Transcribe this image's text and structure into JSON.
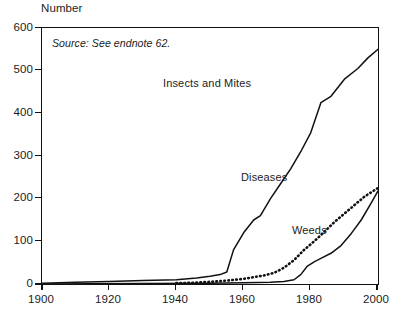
{
  "chart_data": {
    "type": "line",
    "title": "",
    "ylabel": "Number",
    "xlabel": "",
    "annotation": "Source: See endnote 62.",
    "xlim": [
      1900,
      2000
    ],
    "ylim": [
      0,
      600
    ],
    "yticks": [
      0,
      100,
      200,
      300,
      400,
      500,
      600
    ],
    "ytick_labels": [
      "0",
      "100",
      "200",
      "300",
      "400",
      "500",
      "600"
    ],
    "xticks": [
      1900,
      1920,
      1940,
      1960,
      1980,
      2000
    ],
    "xtick_labels": [
      "1900",
      "1920",
      "1940",
      "1960",
      "1980",
      "2000"
    ],
    "grid": false,
    "legend": "inline-labels",
    "series": [
      {
        "name": "Insects and Mites",
        "style": "solid",
        "color": "#111111",
        "x": [
          1900,
          1910,
          1920,
          1930,
          1940,
          1946,
          1950,
          1953,
          1955,
          1957,
          1960,
          1963,
          1965,
          1968,
          1971,
          1974,
          1977,
          1980,
          1983,
          1986,
          1990,
          1994,
          1997,
          2000
        ],
        "values": [
          2,
          4,
          6,
          8,
          10,
          14,
          18,
          22,
          28,
          80,
          120,
          150,
          160,
          200,
          235,
          270,
          310,
          355,
          425,
          440,
          480,
          505,
          530,
          550
        ]
      },
      {
        "name": "Diseases",
        "style": "dotted",
        "color": "#111111",
        "x": [
          1940,
          1945,
          1950,
          1955,
          1960,
          1963,
          1966,
          1969,
          1972,
          1975,
          1978,
          1981,
          1984,
          1987,
          1990,
          1993,
          1996,
          2000
        ],
        "values": [
          2,
          3,
          5,
          8,
          12,
          16,
          20,
          26,
          38,
          56,
          80,
          100,
          122,
          145,
          165,
          185,
          205,
          225
        ]
      },
      {
        "name": "Weeds",
        "style": "solid",
        "color": "#111111",
        "x": [
          1900,
          1930,
          1950,
          1960,
          1968,
          1972,
          1975,
          1977,
          1979,
          1981,
          1983,
          1986,
          1989,
          1992,
          1995,
          1998,
          2000
        ],
        "values": [
          0,
          1,
          2,
          3,
          4,
          6,
          10,
          22,
          42,
          52,
          60,
          72,
          90,
          118,
          150,
          190,
          218
        ]
      }
    ]
  }
}
